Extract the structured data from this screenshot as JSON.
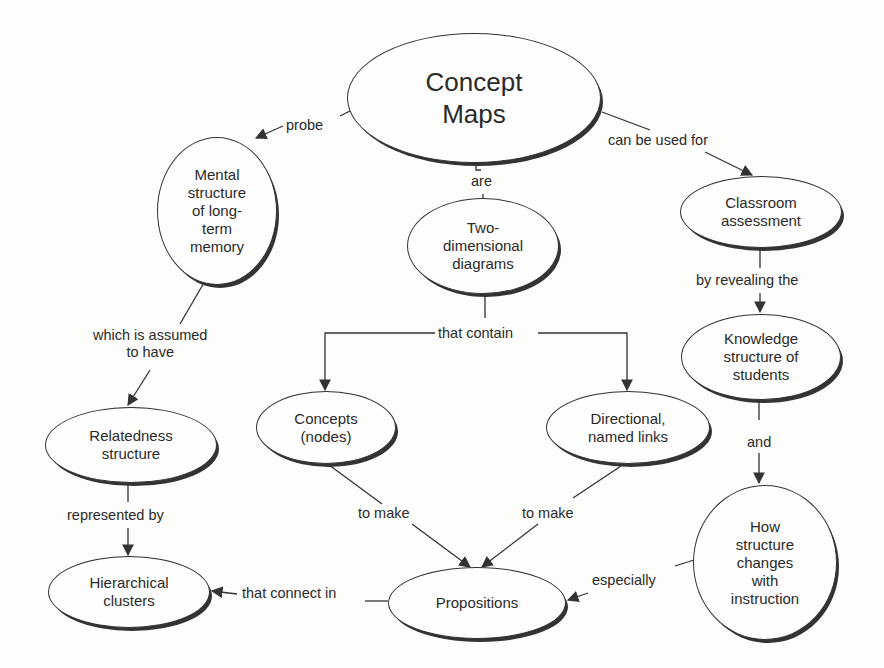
{
  "title": "Concept Maps",
  "nodes": {
    "concept_maps": "Concept\nMaps",
    "mental_structure": "Mental\nstructure\nof long-\nterm\nmemory",
    "two_dimensional": "Two-\ndimensional\ndiagrams",
    "classroom": "Classroom\nassessment",
    "knowledge": "Knowledge\nstructure of\nstudents",
    "relatedness": "Relatedness\nstructure",
    "concepts": "Concepts\n(nodes)",
    "directional": "Directional,\nnamed links",
    "hierarchical": "Hierarchical\nclusters",
    "propositions": "Propositions",
    "how_structure": "How\nstructure\nchanges\nwith\ninstruction"
  },
  "links": {
    "probe": "probe",
    "are": "are",
    "can_be_used_for": "can be used for",
    "which_is_assumed": "which is assumed\nto have",
    "that_contain": "that contain",
    "by_revealing": "by revealing the",
    "and": "and",
    "represented_by": "represented by",
    "to_make_left": "to make",
    "to_make_right": "to make",
    "that_connect_in": "that connect in",
    "especially": "especially"
  }
}
